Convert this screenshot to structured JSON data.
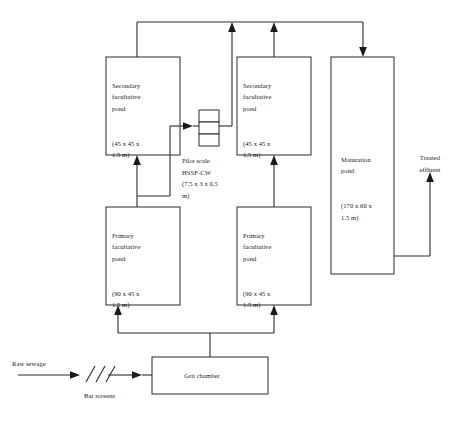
{
  "diagram": {
    "boxes": {
      "secondary_pond_left": {
        "name": "Secondary\nfacultative\npond",
        "dims": "(45 x 45 x\n1.5 m)"
      },
      "secondary_pond_right": {
        "name": "Secondary\nfacultative\npond",
        "dims": "(45 x 45 x\n1.5 m)"
      },
      "primary_pond_left": {
        "name": "Primary\nfacultative\npond",
        "dims": "(90 x 45 x\n1.5 m)"
      },
      "primary_pond_right": {
        "name": "Primary\nfacultative\npond",
        "dims": "(90 x 45 x\n1.5 m)"
      },
      "maturation_pond": {
        "name": "Maturation\npond",
        "dims": "(170 x 60 x\n1.5 m)"
      },
      "grit_chamber": {
        "label": "Grit chamber"
      },
      "pilot_cw": {
        "label": "Pilot scale\nHSSF-CW\n(7.5 x 3 x 0.5\nm)"
      }
    },
    "labels": {
      "raw_sewage": "Raw sewage",
      "bar_screens": "Bar screens",
      "treated_effluent": "Treated\neffluent"
    },
    "colors": {
      "stroke": "#2b2b2b",
      "text": "#1a1a1a",
      "background": "#ffffff"
    }
  }
}
